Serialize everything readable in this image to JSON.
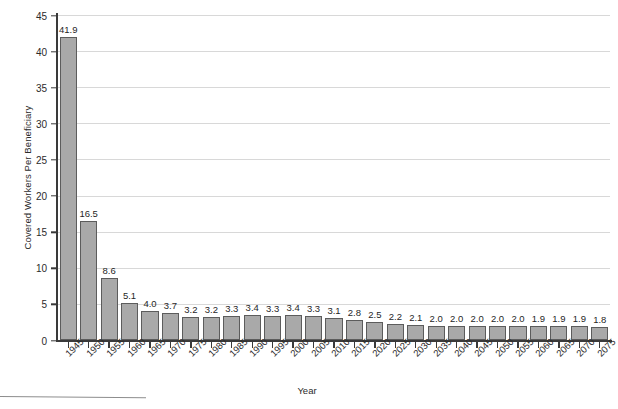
{
  "chart_data": {
    "type": "bar",
    "title": "",
    "xlabel": "Year",
    "ylabel": "Covered Workers Per Beneficiary",
    "ylim": [
      0,
      45
    ],
    "ytick_step": 5,
    "grid": true,
    "legend": null,
    "bar_color": "#a9a9a9",
    "bar_edge_color": "#5c5c5c",
    "categories": [
      "1945",
      "1950",
      "1955",
      "1960",
      "1965",
      "1970",
      "1975",
      "1980",
      "1985",
      "1990",
      "1995",
      "2000",
      "2005",
      "2010",
      "2015",
      "2020",
      "2025",
      "2030",
      "2035",
      "2040",
      "2045",
      "2050",
      "2055",
      "2060",
      "2065",
      "2070",
      "2075"
    ],
    "values": [
      41.9,
      16.5,
      8.6,
      5.1,
      4.0,
      3.7,
      3.2,
      3.2,
      3.3,
      3.4,
      3.3,
      3.4,
      3.3,
      3.1,
      2.8,
      2.5,
      2.2,
      2.1,
      2.0,
      2.0,
      2.0,
      2.0,
      2.0,
      1.9,
      1.9,
      1.9,
      1.8
    ],
    "value_labels": [
      "41.9",
      "16.5",
      "8.6",
      "5.1",
      "4.0",
      "3.7",
      "3.2",
      "3.2",
      "3.3",
      "3.4",
      "3.3",
      "3.4",
      "3.3",
      "3.1",
      "2.8",
      "2.5",
      "2.2",
      "2.1",
      "2.0",
      "2.0",
      "2.0",
      "2.0",
      "2.0",
      "1.9",
      "1.9",
      "1.9",
      "1.8"
    ],
    "ytick_labels": [
      "0",
      "5",
      "10",
      "15",
      "20",
      "25",
      "30",
      "35",
      "40",
      "45"
    ],
    "ytick_values": [
      0,
      5,
      10,
      15,
      20,
      25,
      30,
      35,
      40,
      45
    ]
  }
}
